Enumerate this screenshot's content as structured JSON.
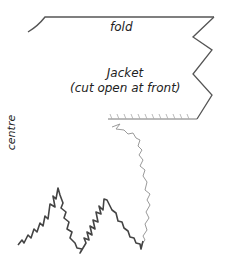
{
  "diagram": {
    "labels": {
      "fold": "fold",
      "jacket_title": "Jacket",
      "jacket_subtitle": "(cut open at front)",
      "centre": "centre"
    },
    "colors": {
      "line": "#444444",
      "line_light": "#9a9a9a",
      "background": "#ffffff"
    }
  }
}
